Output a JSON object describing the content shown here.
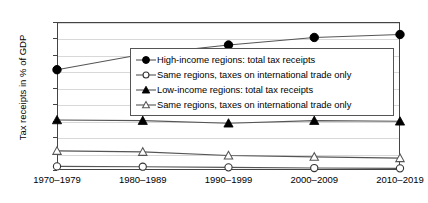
{
  "chart_data": {
    "type": "line",
    "title": "",
    "xlabel": "",
    "ylabel": "Tax receipts in % of GDP",
    "categories": [
      "1970–1979",
      "1980–1989",
      "1990–1999",
      "2000–2009",
      "2010–2019"
    ],
    "ylim": [
      0,
      45
    ],
    "ytick_labels": [
      "0%",
      "5%",
      "10%",
      "15%",
      "20%",
      "25%",
      "30%",
      "35%",
      "40%",
      "45%"
    ],
    "ytick_values": [
      0,
      5,
      10,
      15,
      20,
      25,
      30,
      35,
      40,
      45
    ],
    "grid": true,
    "legend_position": "upper-right-inside",
    "series": [
      {
        "name": "High-income regions: total tax receipts",
        "marker": "filled-circle",
        "values": [
          30.5,
          35.2,
          38.0,
          40.3,
          41.2
        ]
      },
      {
        "name": "Same regions, taxes on international trade only",
        "marker": "open-circle",
        "values": [
          1.1,
          1.0,
          0.8,
          0.6,
          0.5
        ]
      },
      {
        "name": "Low-income regions: total tax receipts",
        "marker": "filled-triangle",
        "values": [
          15.2,
          15.0,
          14.2,
          15.0,
          14.8
        ]
      },
      {
        "name": "Same regions, taxes on international trade only",
        "marker": "open-triangle",
        "values": [
          5.8,
          5.5,
          4.4,
          4.0,
          3.6
        ]
      }
    ]
  },
  "colors": {
    "axis": "#444444",
    "grid": "#d8d8d8",
    "series_line": "#555555",
    "marker_fill": "#000000",
    "background": "#ffffff"
  }
}
